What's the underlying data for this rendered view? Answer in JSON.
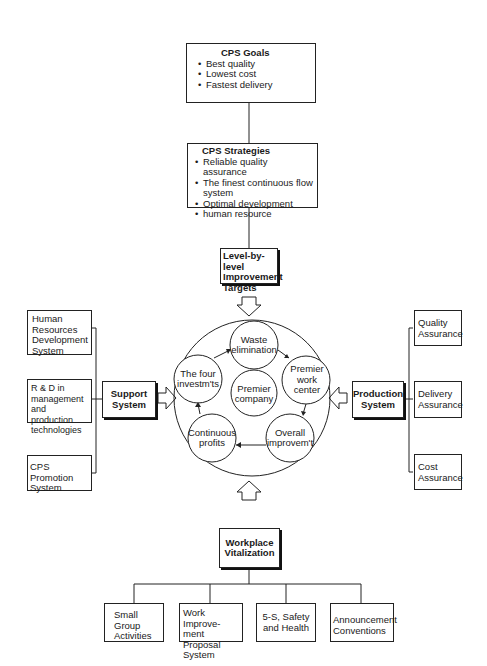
{
  "goals": {
    "title": "CPS Goals",
    "items": [
      "Best quality",
      "Lowest cost",
      "Fastest delivery"
    ]
  },
  "strategies": {
    "title": "CPS Strategies",
    "items": [
      "Reliable quality assurance",
      "The finest continuous flow system",
      "Optimal development",
      "human resource"
    ]
  },
  "targets": {
    "label": "Level-by-level Improvement Targets"
  },
  "cycle": {
    "center": "Premier company",
    "nodes": [
      "Waste elimination",
      "Premier work center",
      "Overall improvem't",
      "Continuous profits",
      "The four investm'ts"
    ]
  },
  "support": {
    "label": "Support System",
    "items": [
      "Human Resources Development System",
      "R & D in management and production technologies",
      "CPS Promotion System"
    ]
  },
  "production": {
    "label": "Production System",
    "items": [
      "Quality Assurance",
      "Delivery Assurance",
      "Cost Assurance"
    ]
  },
  "workplace": {
    "label": "Workplace Vitalization",
    "items": [
      "Small Group Activities",
      "Work Improve-ment Proposal System",
      "5-S, Safety and Health",
      "Announcement Conventions"
    ]
  }
}
